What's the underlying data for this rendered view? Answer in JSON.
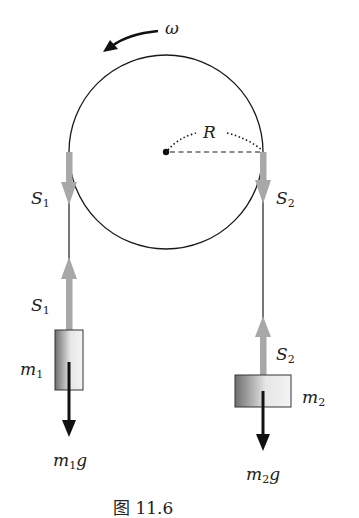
{
  "figure": {
    "caption": "图 11.6",
    "labels": {
      "omega": "ω",
      "radius": "R",
      "s1_top": {
        "base": "S",
        "sub": "1"
      },
      "s1_bottom": {
        "base": "S",
        "sub": "1"
      },
      "s2_top": {
        "base": "S",
        "sub": "2"
      },
      "s2_bottom": {
        "base": "S",
        "sub": "2"
      },
      "m1": {
        "base": "m",
        "sub": "1"
      },
      "m2": {
        "base": "m",
        "sub": "2"
      },
      "m1g": {
        "base": "m",
        "sub": "1",
        "tail": "g"
      },
      "m2g": {
        "base": "m",
        "sub": "2",
        "tail": "g"
      }
    },
    "colors": {
      "line": "#1a1a1a",
      "tension_arrow": "#a8a8a8",
      "gravity_arrow": "#111111",
      "block_dark": "#6e6e6e",
      "block_light": "#f2f2f2"
    }
  }
}
